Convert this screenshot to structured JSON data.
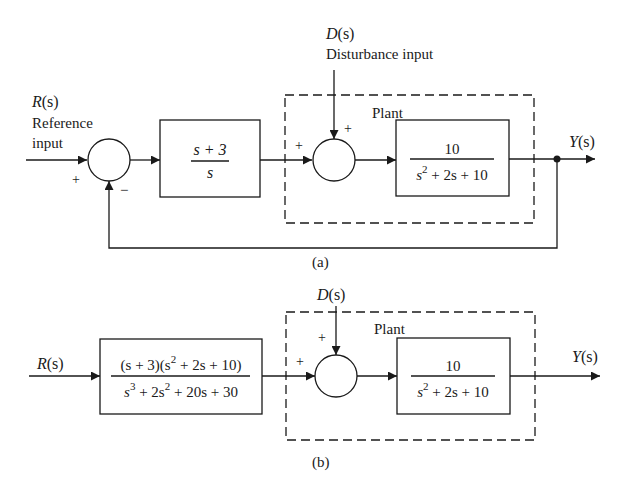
{
  "diagram": {
    "a": {
      "caption": "(a)",
      "reference": {
        "symbol": "R",
        "arg": "(s)",
        "label_line1": "Reference",
        "label_line2": "input"
      },
      "disturbance": {
        "symbol": "D",
        "arg": "(s)",
        "label": "Disturbance input"
      },
      "sum1": {
        "sign_in": "+",
        "sign_fb": "−"
      },
      "controller": {
        "num": "s + 3",
        "den": "s"
      },
      "sum2": {
        "sign_in": "+",
        "sign_d": "+"
      },
      "plant": {
        "title": "Plant",
        "num": "10",
        "den_s": "s",
        "den_exp": "2",
        "den_rest": " + 2s + 10"
      },
      "output": {
        "symbol": "Y",
        "arg": "(s)"
      }
    },
    "b": {
      "caption": "(b)",
      "reference": {
        "symbol": "R",
        "arg": "(s)"
      },
      "disturbance": {
        "symbol": "D",
        "arg": "(s)"
      },
      "prefilter": {
        "num_a": "(s + 3)(s",
        "num_exp": "2",
        "num_b": " + 2s + 10)",
        "den_a": "s",
        "den_exp1": "3",
        "den_b": " + 2s",
        "den_exp2": "2",
        "den_c": " + 20s + 30"
      },
      "sum": {
        "sign_in": "+",
        "sign_d": "+"
      },
      "plant": {
        "title": "Plant",
        "num": "10",
        "den_s": "s",
        "den_exp": "2",
        "den_rest": " + 2s + 10"
      },
      "output": {
        "symbol": "Y",
        "arg": "(s)"
      }
    }
  }
}
